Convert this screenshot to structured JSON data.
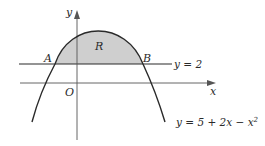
{
  "diagram": {
    "labels": {
      "y_axis": "y",
      "x_axis": "x",
      "origin": "O",
      "point_a": "A",
      "point_b": "B",
      "region": "R",
      "line_equation": "y = 2",
      "curve_equation_main": "y = 5 + 2x − x",
      "curve_equation_exp": "2"
    },
    "colors": {
      "stroke": "#2a2a2a",
      "axis": "#555555",
      "shade": "#cfcfcf",
      "background": "#ffffff"
    }
  }
}
